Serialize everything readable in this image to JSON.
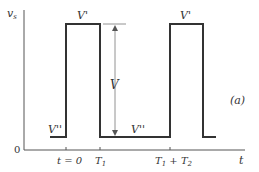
{
  "diagram": {
    "type": "rectangular-pulse-waveform",
    "panel_label": "(a)",
    "y_axis": {
      "label": "v",
      "label_subscript": "s",
      "origin_label": "0"
    },
    "x_axis": {
      "label": "t",
      "ticks": [
        {
          "label": "t = 0",
          "x": 66
        },
        {
          "label": "T",
          "sub": "1",
          "x": 100
        },
        {
          "label": "T",
          "sub": "1",
          "plus": " + T",
          "sub2": "2",
          "x": 170
        }
      ]
    },
    "levels": {
      "high": {
        "label": "V'",
        "y": 24
      },
      "low": {
        "label": "V''",
        "y": 137
      },
      "amplitude": {
        "label": "V"
      }
    },
    "waveform_points": [
      [
        50,
        137
      ],
      [
        66,
        137
      ],
      [
        66,
        24
      ],
      [
        100,
        24
      ],
      [
        100,
        137
      ],
      [
        170,
        137
      ],
      [
        170,
        24
      ],
      [
        203,
        24
      ],
      [
        203,
        137
      ],
      [
        216,
        137
      ]
    ],
    "labels": {
      "high_1": "V'",
      "high_2": "V'",
      "low_1": "V''",
      "low_2": "V''",
      "amp": "V",
      "t0": "t = 0",
      "T1": "T",
      "T1_sub": "1",
      "T12_a": "T",
      "T12_a_sub": "1",
      "T12_plus": " + T",
      "T12_b_sub": "2",
      "t": "t",
      "vs": "v",
      "vs_sub": "s",
      "zero": "0",
      "panel": "(a)"
    },
    "colors": {
      "line": "#333333",
      "axis": "#555555",
      "reference": "#777777"
    }
  }
}
